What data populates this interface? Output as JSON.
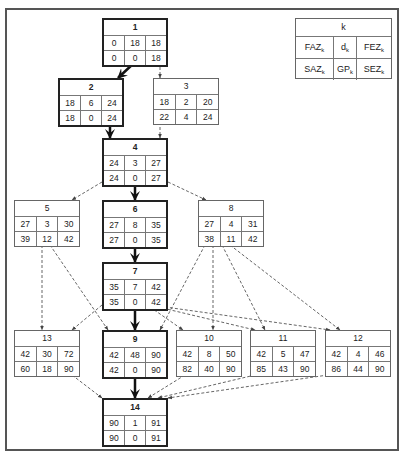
{
  "legend": {
    "title": "k",
    "row1": [
      {
        "base": "FAZ",
        "sub": "k"
      },
      {
        "base": "d",
        "sub": "k"
      },
      {
        "base": "FEZ",
        "sub": "k"
      }
    ],
    "row2": [
      {
        "base": "SAZ",
        "sub": "k"
      },
      {
        "base": "GP",
        "sub": "k"
      },
      {
        "base": "SEZ",
        "sub": "k"
      }
    ]
  },
  "nodes": {
    "n1": {
      "id": "1",
      "critical": true,
      "faz": "0",
      "d": "18",
      "fez": "18",
      "saz": "0",
      "gp": "0",
      "sez": "18"
    },
    "n2": {
      "id": "2",
      "critical": true,
      "faz": "18",
      "d": "6",
      "fez": "24",
      "saz": "18",
      "gp": "0",
      "sez": "24"
    },
    "n3": {
      "id": "3",
      "critical": false,
      "faz": "18",
      "d": "2",
      "fez": "20",
      "saz": "22",
      "gp": "4",
      "sez": "24"
    },
    "n4": {
      "id": "4",
      "critical": true,
      "faz": "24",
      "d": "3",
      "fez": "27",
      "saz": "24",
      "gp": "0",
      "sez": "27"
    },
    "n5": {
      "id": "5",
      "critical": false,
      "faz": "27",
      "d": "3",
      "fez": "30",
      "saz": "39",
      "gp": "12",
      "sez": "42"
    },
    "n6": {
      "id": "6",
      "critical": true,
      "faz": "27",
      "d": "8",
      "fez": "35",
      "saz": "27",
      "gp": "0",
      "sez": "35"
    },
    "n8": {
      "id": "8",
      "critical": false,
      "faz": "27",
      "d": "4",
      "fez": "31",
      "saz": "38",
      "gp": "11",
      "sez": "42"
    },
    "n7": {
      "id": "7",
      "critical": true,
      "faz": "35",
      "d": "7",
      "fez": "42",
      "saz": "35",
      "gp": "0",
      "sez": "42"
    },
    "n13": {
      "id": "13",
      "critical": false,
      "faz": "42",
      "d": "30",
      "fez": "72",
      "saz": "60",
      "gp": "18",
      "sez": "90"
    },
    "n9": {
      "id": "9",
      "critical": true,
      "faz": "42",
      "d": "48",
      "fez": "90",
      "saz": "42",
      "gp": "0",
      "sez": "90"
    },
    "n10": {
      "id": "10",
      "critical": false,
      "faz": "42",
      "d": "8",
      "fez": "50",
      "saz": "82",
      "gp": "40",
      "sez": "90"
    },
    "n11": {
      "id": "11",
      "critical": false,
      "faz": "42",
      "d": "5",
      "fez": "47",
      "saz": "85",
      "gp": "43",
      "sez": "90"
    },
    "n12": {
      "id": "12",
      "critical": false,
      "faz": "42",
      "d": "4",
      "fez": "46",
      "saz": "86",
      "gp": "44",
      "sez": "90"
    },
    "n14": {
      "id": "14",
      "critical": true,
      "faz": "90",
      "d": "1",
      "fez": "91",
      "saz": "90",
      "gp": "0",
      "sez": "91"
    }
  },
  "edges": [
    {
      "from": "1",
      "to": "2",
      "critical": true
    },
    {
      "from": "1",
      "to": "3",
      "critical": false
    },
    {
      "from": "2",
      "to": "4",
      "critical": true
    },
    {
      "from": "3",
      "to": "4",
      "critical": false
    },
    {
      "from": "4",
      "to": "5",
      "critical": false
    },
    {
      "from": "4",
      "to": "6",
      "critical": true
    },
    {
      "from": "4",
      "to": "8",
      "critical": false
    },
    {
      "from": "6",
      "to": "7",
      "critical": true
    },
    {
      "from": "5",
      "to": "13",
      "critical": false
    },
    {
      "from": "5",
      "to": "9",
      "critical": false
    },
    {
      "from": "8",
      "to": "9",
      "critical": false
    },
    {
      "from": "8",
      "to": "10",
      "critical": false
    },
    {
      "from": "8",
      "to": "11",
      "critical": false
    },
    {
      "from": "8",
      "to": "12",
      "critical": false
    },
    {
      "from": "7",
      "to": "13",
      "critical": false
    },
    {
      "from": "7",
      "to": "9",
      "critical": true
    },
    {
      "from": "7",
      "to": "10",
      "critical": false
    },
    {
      "from": "7",
      "to": "11",
      "critical": false
    },
    {
      "from": "7",
      "to": "12",
      "critical": false
    },
    {
      "from": "13",
      "to": "14",
      "critical": false
    },
    {
      "from": "9",
      "to": "14",
      "critical": true
    },
    {
      "from": "10",
      "to": "14",
      "critical": false
    },
    {
      "from": "11",
      "to": "14",
      "critical": false
    },
    {
      "from": "12",
      "to": "14",
      "critical": false
    }
  ]
}
